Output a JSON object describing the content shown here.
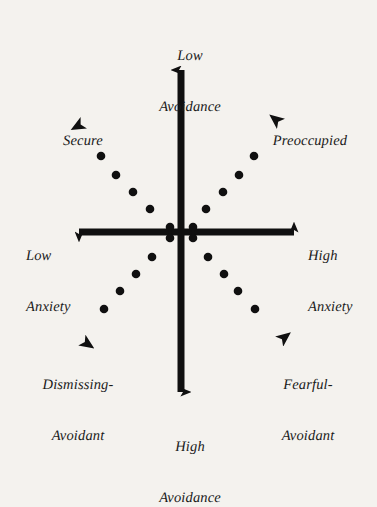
{
  "diagram": {
    "background_color": "#f4f2ee",
    "ink_color": "#101010",
    "axes": {
      "vertical": {
        "name": "Avoidance",
        "top_label": "Low\nAvoidance",
        "top_label_line1": "Low",
        "top_label_line2": "Avoidance",
        "bottom_label": "High\nAvoidance",
        "bottom_label_line1": "High",
        "bottom_label_line2": "Avoidance"
      },
      "horizontal": {
        "name": "Anxiety",
        "left_label": "Low\nAnxiety",
        "left_label_line1": "Low",
        "left_label_line2": "Anxiety",
        "right_label": "High\nAnxiety",
        "right_label_line1": "High",
        "right_label_line2": "Anxiety"
      }
    },
    "quadrants": [
      {
        "id": "secure",
        "label": "Secure",
        "label_line1": "Secure",
        "label_line2": "",
        "position": "upper-left",
        "anxiety": "low",
        "avoidance": "low"
      },
      {
        "id": "preoccupied",
        "label": "Preoccupied",
        "label_line1": "Preoccupied",
        "label_line2": "",
        "position": "upper-right",
        "anxiety": "high",
        "avoidance": "low"
      },
      {
        "id": "dismissing-avoidant",
        "label": "Dismissing-\nAvoidant",
        "label_line1": "Dismissing-",
        "label_line2": "Avoidant",
        "position": "lower-left",
        "anxiety": "low",
        "avoidance": "high"
      },
      {
        "id": "fearful-avoidant",
        "label": "Fearful-\nAvoidant",
        "label_line1": "Fearful-",
        "label_line2": "Avoidant",
        "position": "lower-right",
        "anxiety": "high",
        "avoidance": "high"
      }
    ]
  },
  "chart_data": {
    "type": "scatter",
    "xlabel": "Anxiety",
    "ylabel": "Avoidance",
    "xlim": [
      -1,
      1
    ],
    "ylim": [
      -1,
      1
    ],
    "grid": false,
    "legend": "none",
    "origin_px": [
      181,
      232
    ],
    "axis_lines": [
      {
        "name": "avoidance-axis",
        "orientation": "vertical",
        "from_px": [
          181,
          397
        ],
        "to_px": [
          181,
          62
        ],
        "double_headed": true,
        "stroke_width_px": 7
      },
      {
        "name": "anxiety-axis",
        "orientation": "horizontal",
        "from_px": [
          73,
          232
        ],
        "to_px": [
          300,
          232
        ],
        "double_headed": true,
        "stroke_width_px": 7
      }
    ],
    "series": [
      {
        "name": "secure-ray",
        "quadrant": "upper-left",
        "style": "dotted-diagonal",
        "arrow_tip_px": [
          82,
          122
        ],
        "dots_px": [
          [
            170,
            227
          ],
          [
            150,
            209
          ],
          [
            133,
            192
          ],
          [
            116,
            175
          ],
          [
            101,
            156
          ]
        ]
      },
      {
        "name": "preoccupied-ray",
        "quadrant": "upper-right",
        "style": "dotted-diagonal",
        "arrow_tip_px": [
          281,
          122
        ],
        "dots_px": [
          [
            193,
            227
          ],
          [
            206,
            209
          ],
          [
            223,
            192
          ],
          [
            239,
            175
          ],
          [
            254,
            156
          ]
        ]
      },
      {
        "name": "dismissing-avoidant-ray",
        "quadrant": "lower-left",
        "style": "dotted-diagonal",
        "arrow_tip_px": [
          82,
          342
        ],
        "dots_px": [
          [
            170,
            238
          ],
          [
            152,
            257
          ],
          [
            136,
            274
          ],
          [
            120,
            291
          ],
          [
            104,
            309
          ]
        ]
      },
      {
        "name": "fearful-avoidant-ray",
        "quadrant": "lower-right",
        "style": "dotted-diagonal",
        "arrow_tip_px": [
          281,
          342
        ],
        "dots_px": [
          [
            193,
            238
          ],
          [
            208,
            257
          ],
          [
            224,
            274
          ],
          [
            238,
            291
          ],
          [
            255,
            309
          ]
        ]
      }
    ],
    "dot_radius_px": 4.3,
    "annotations": [
      {
        "text": "Low Avoidance",
        "at_px": [
          190,
          30
        ],
        "align": "center"
      },
      {
        "text": "High Avoidance",
        "at_px": [
          190,
          422
        ],
        "align": "center"
      },
      {
        "text": "Low Anxiety",
        "at_px": [
          57,
          231
        ],
        "align": "center"
      },
      {
        "text": "High Anxiety",
        "at_px": [
          342,
          231
        ],
        "align": "center"
      },
      {
        "text": "Secure",
        "at_px": [
          83,
          108
        ],
        "align": "center"
      },
      {
        "text": "Preoccupied",
        "at_px": [
          310,
          108
        ],
        "align": "center"
      },
      {
        "text": "Dismissing-Avoidant",
        "at_px": [
          78,
          360
        ],
        "align": "center"
      },
      {
        "text": "Fearful-Avoidant",
        "at_px": [
          308,
          360
        ],
        "align": "center"
      }
    ]
  }
}
